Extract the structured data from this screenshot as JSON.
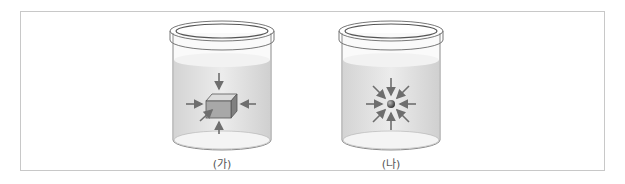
{
  "figures": [
    {
      "id": "ga",
      "label": "(가)",
      "object": "cube",
      "description": "cube submerged in liquid with pressure arrows from all directions"
    },
    {
      "id": "na",
      "label": "(나)",
      "object": "sphere",
      "description": "small sphere submerged in liquid with pressure arrows converging from all directions"
    }
  ],
  "colors": {
    "frame": "#c8c8c8",
    "liquid": "#e4e4e4",
    "arrow": "#6e6e6e",
    "glass": "#8a8a8a"
  }
}
